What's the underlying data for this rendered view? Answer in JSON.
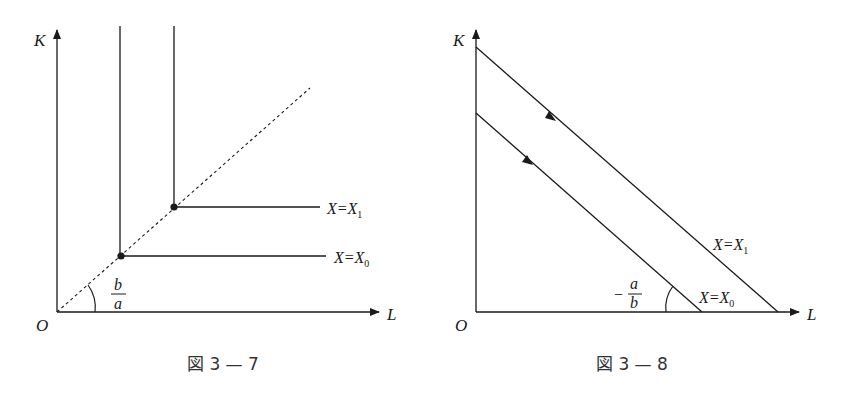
{
  "figures": [
    {
      "caption": "図 3 — 7",
      "axis_y_label": "K",
      "axis_x_label": "L",
      "origin_label": "O",
      "slope_label": {
        "numerator": "b",
        "denominator": "a"
      },
      "isoquants": [
        {
          "label_lhs": "X=X",
          "label_sub": "0"
        },
        {
          "label_lhs": "X=X",
          "label_sub": "1"
        }
      ],
      "ray_style": "dashed"
    },
    {
      "caption": "図 3 — 8",
      "axis_y_label": "K",
      "axis_x_label": "L",
      "origin_label": "O",
      "slope_label": {
        "sign": "−",
        "numerator": "a",
        "denominator": "b"
      },
      "isoquants": [
        {
          "label_lhs": "X=X",
          "label_sub": "0"
        },
        {
          "label_lhs": "X=X",
          "label_sub": "1"
        }
      ]
    }
  ],
  "colors": {
    "ink": "#1a1a1a",
    "background": "#ffffff"
  }
}
